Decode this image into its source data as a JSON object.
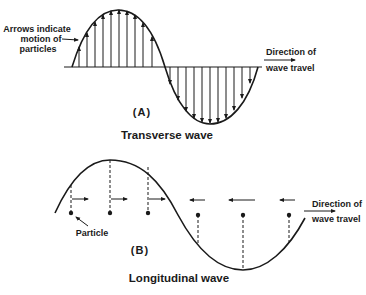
{
  "colors": {
    "ink": "#1a1a1a",
    "background": "#ffffff"
  },
  "panel_a": {
    "label": "(A)",
    "caption": "Transverse wave",
    "annotation_line1": "Arrows indicate",
    "annotation_line2": "motion of",
    "annotation_line3": "particles",
    "direction_line1": "Direction of",
    "direction_line2": "wave travel",
    "arrow_direction_up": "up",
    "arrow_direction_down": "down"
  },
  "panel_b": {
    "label": "(B)",
    "caption": "Longitudinal wave",
    "particle_label": "Particle",
    "direction_line1": "Direction of",
    "direction_line2": "wave travel"
  }
}
